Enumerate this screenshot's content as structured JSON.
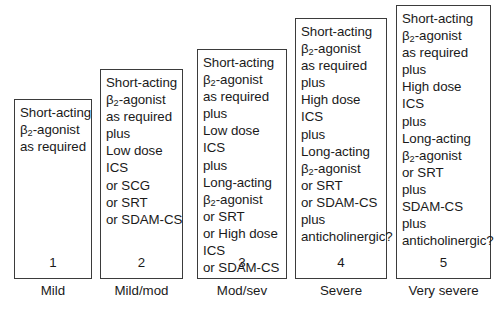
{
  "diagram": {
    "title_visible": false,
    "box_border_color": "#3b3b3b",
    "box_background_color": "#ffffff",
    "text_color": "#1a1a1a",
    "steps": [
      {
        "number": "1",
        "severity_label": "Mild",
        "lines": [
          {
            "pre": "Short-acting",
            "sub": "",
            "post": ""
          },
          {
            "pre": "β",
            "sub": "2",
            "post": "-agonist"
          },
          {
            "pre": "as required",
            "sub": "",
            "post": ""
          }
        ]
      },
      {
        "number": "2",
        "severity_label": "Mild/mod",
        "lines": [
          {
            "pre": "Short-acting",
            "sub": "",
            "post": ""
          },
          {
            "pre": "β",
            "sub": "2",
            "post": "-agonist"
          },
          {
            "pre": "as required",
            "sub": "",
            "post": ""
          },
          {
            "pre": "plus",
            "sub": "",
            "post": ""
          },
          {
            "pre": "Low dose",
            "sub": "",
            "post": ""
          },
          {
            "pre": "ICS",
            "sub": "",
            "post": ""
          },
          {
            "pre": "or SCG",
            "sub": "",
            "post": ""
          },
          {
            "pre": "or SRT",
            "sub": "",
            "post": ""
          },
          {
            "pre": "or SDAM-CS",
            "sub": "",
            "post": ""
          }
        ]
      },
      {
        "number": "3",
        "severity_label": "Mod/sev",
        "lines": [
          {
            "pre": "Short-acting",
            "sub": "",
            "post": ""
          },
          {
            "pre": "β",
            "sub": "2",
            "post": "-agonist"
          },
          {
            "pre": "as required",
            "sub": "",
            "post": ""
          },
          {
            "pre": "plus",
            "sub": "",
            "post": ""
          },
          {
            "pre": "Low dose",
            "sub": "",
            "post": ""
          },
          {
            "pre": "ICS",
            "sub": "",
            "post": ""
          },
          {
            "pre": "plus",
            "sub": "",
            "post": ""
          },
          {
            "pre": "Long-acting",
            "sub": "",
            "post": ""
          },
          {
            "pre": "β",
            "sub": "2",
            "post": "-agonist"
          },
          {
            "pre": "or SRT",
            "sub": "",
            "post": ""
          },
          {
            "pre": "or High dose",
            "sub": "",
            "post": ""
          },
          {
            "pre": "ICS",
            "sub": "",
            "post": ""
          },
          {
            "pre": "or SDAM-CS",
            "sub": "",
            "post": ""
          }
        ]
      },
      {
        "number": "4",
        "severity_label": "Severe",
        "lines": [
          {
            "pre": "Short-acting",
            "sub": "",
            "post": ""
          },
          {
            "pre": "β",
            "sub": "2",
            "post": "-agonist"
          },
          {
            "pre": "as required",
            "sub": "",
            "post": ""
          },
          {
            "pre": "plus",
            "sub": "",
            "post": ""
          },
          {
            "pre": "High dose",
            "sub": "",
            "post": ""
          },
          {
            "pre": "ICS",
            "sub": "",
            "post": ""
          },
          {
            "pre": "plus",
            "sub": "",
            "post": ""
          },
          {
            "pre": "Long-acting",
            "sub": "",
            "post": ""
          },
          {
            "pre": "β",
            "sub": "2",
            "post": "-agonist"
          },
          {
            "pre": "or SRT",
            "sub": "",
            "post": ""
          },
          {
            "pre": "or SDAM-CS",
            "sub": "",
            "post": ""
          },
          {
            "pre": "plus",
            "sub": "",
            "post": ""
          },
          {
            "pre": "anticholinergic?",
            "sub": "",
            "post": ""
          }
        ]
      },
      {
        "number": "5",
        "severity_label": "Very severe",
        "lines": [
          {
            "pre": "Short-acting",
            "sub": "",
            "post": ""
          },
          {
            "pre": "β",
            "sub": "2",
            "post": "-agonist"
          },
          {
            "pre": "as required",
            "sub": "",
            "post": ""
          },
          {
            "pre": "plus",
            "sub": "",
            "post": ""
          },
          {
            "pre": "High dose",
            "sub": "",
            "post": ""
          },
          {
            "pre": "ICS",
            "sub": "",
            "post": ""
          },
          {
            "pre": "plus",
            "sub": "",
            "post": ""
          },
          {
            "pre": "Long-acting",
            "sub": "",
            "post": ""
          },
          {
            "pre": "β",
            "sub": "2",
            "post": "-agonist"
          },
          {
            "pre": "or SRT",
            "sub": "",
            "post": ""
          },
          {
            "pre": "plus",
            "sub": "",
            "post": ""
          },
          {
            "pre": "SDAM-CS",
            "sub": "",
            "post": ""
          },
          {
            "pre": "plus",
            "sub": "",
            "post": ""
          },
          {
            "pre": "anticholinergic?",
            "sub": "",
            "post": ""
          }
        ]
      }
    ]
  },
  "layout": {
    "columns": [
      {
        "left": 14,
        "width": 78,
        "box_top": 99,
        "box_bottom": 279,
        "label_top": 283
      },
      {
        "left": 100,
        "width": 83,
        "box_top": 69,
        "box_bottom": 279,
        "label_top": 283
      },
      {
        "left": 197,
        "width": 90,
        "box_top": 49,
        "box_bottom": 279,
        "label_top": 283
      },
      {
        "left": 295,
        "width": 92,
        "box_top": 18,
        "box_bottom": 279,
        "label_top": 283
      },
      {
        "left": 396,
        "width": 95,
        "box_top": 5,
        "box_bottom": 279,
        "label_top": 283
      }
    ]
  }
}
